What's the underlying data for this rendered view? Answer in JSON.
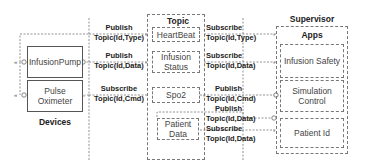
{
  "devices": {
    "label": "Devices",
    "items": [
      {
        "name": "InfusionPump"
      },
      {
        "name": "Pulse Oximeter",
        "line1": "Pulse",
        "line2": "Oximeter"
      }
    ]
  },
  "topic": {
    "label": "Topic",
    "items": [
      {
        "line1": "HeartBeat",
        "line2": ""
      },
      {
        "line1": "Infusion",
        "line2": "Status"
      },
      {
        "line1": "Spo2",
        "line2": ""
      },
      {
        "line1": "Patient",
        "line2": "Data"
      }
    ]
  },
  "supervisor": {
    "label": "Supervisor",
    "apps_label": "Apps",
    "items": [
      {
        "line1": "Infusion Safety",
        "line2": ""
      },
      {
        "line1": "Simulation",
        "line2": "Control"
      },
      {
        "line1": "Patient Id",
        "line2": ""
      }
    ]
  },
  "left_links": [
    {
      "action": "Publish",
      "topic": "Topic(Id,Type)"
    },
    {
      "action": "Publish",
      "topic": "Topic(Id,Data)"
    },
    {
      "action": "Subscribe",
      "topic": "Topic(Id,Cmd)"
    }
  ],
  "right_links": [
    {
      "action": "Subscribe",
      "topic": "Topic(Id,Type)"
    },
    {
      "action": "Subscribe",
      "topic": "Topic(Id,Data)"
    },
    {
      "action": "Publish",
      "topic": "Topic(Id,Cmd)"
    },
    {
      "action": "Publish",
      "topic": "Topic(Id,Data)"
    },
    {
      "action": "Subscribe",
      "topic": "Topic(Id,Data)"
    }
  ]
}
